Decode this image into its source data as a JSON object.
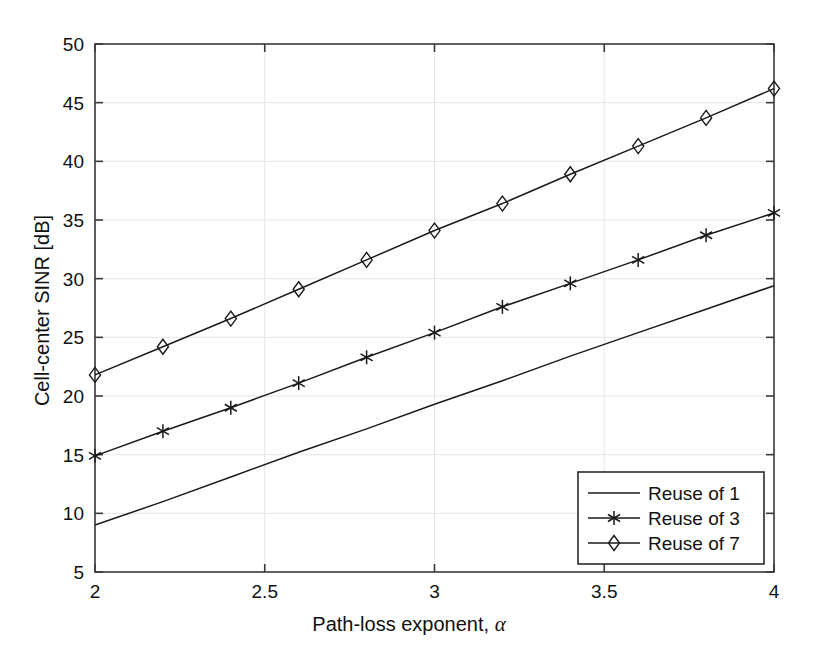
{
  "chart_data": {
    "type": "line",
    "title": "",
    "xlabel": "Path-loss exponent, α",
    "ylabel": "Cell-center SINR [dB]",
    "xlim": [
      2,
      4
    ],
    "ylim": [
      5,
      50
    ],
    "xticks": [
      2,
      2.5,
      3,
      3.5,
      4
    ],
    "xtick_labels": [
      "2",
      "2.5",
      "3",
      "3.5",
      "4"
    ],
    "yticks": [
      5,
      10,
      15,
      20,
      25,
      30,
      35,
      40,
      45,
      50
    ],
    "ytick_labels": [
      "5",
      "10",
      "15",
      "20",
      "25",
      "30",
      "35",
      "40",
      "45",
      "50"
    ],
    "grid": true,
    "legend_position": "lower right",
    "x": [
      2,
      2.2,
      2.4,
      2.6,
      2.8,
      3,
      3.2,
      3.4,
      3.6,
      3.8,
      4
    ],
    "series": [
      {
        "name": "Reuse of 1",
        "marker": "none",
        "color": "#1a1a1a",
        "values": [
          9.0,
          11.0,
          13.1,
          15.2,
          17.2,
          19.3,
          21.3,
          23.4,
          25.4,
          27.4,
          29.4
        ]
      },
      {
        "name": "Reuse of 3",
        "marker": "asterisk",
        "color": "#1a1a1a",
        "values": [
          14.9,
          17.0,
          19.0,
          21.1,
          23.3,
          25.4,
          27.6,
          29.6,
          31.6,
          33.7,
          35.6
        ]
      },
      {
        "name": "Reuse of 7",
        "marker": "diamond",
        "color": "#1a1a1a",
        "values": [
          21.8,
          24.2,
          26.6,
          29.1,
          31.6,
          34.1,
          36.4,
          38.9,
          41.3,
          43.7,
          46.2
        ]
      }
    ]
  },
  "legend": {
    "items": [
      {
        "label": "Reuse of 1",
        "marker": "none"
      },
      {
        "label": "Reuse of 3",
        "marker": "asterisk"
      },
      {
        "label": "Reuse of 7",
        "marker": "diamond"
      }
    ]
  },
  "axes": {
    "x_title": "Path-loss exponent, ",
    "x_title_symbol": "α",
    "y_title": "Cell-center SINR [dB]"
  },
  "colors": {
    "line": "#1a1a1a",
    "axis": "#3a3a3a",
    "grid": "#e6e6e6",
    "background": "#ffffff"
  }
}
